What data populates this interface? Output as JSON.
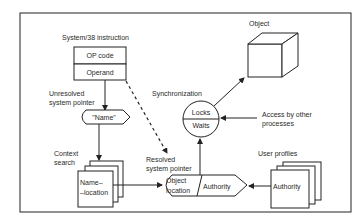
{
  "diagram": {
    "instruction": {
      "title": "System/38 instruction",
      "opcode": "OP code",
      "operand": "Operand"
    },
    "unresolved_label_line1": "Unresolved",
    "unresolved_label_line2": "system pointer",
    "name_token": "\"Name\"",
    "context_label_line1": "Context",
    "context_label_line2": "search",
    "name_location_line1": "Name–",
    "name_location_line2": "–location",
    "resolved_label_line1": "Resolved",
    "resolved_label_line2": "system pointer",
    "resolved_pointer": {
      "left_line1": "Object",
      "left_line2": "location",
      "right": "Authority"
    },
    "synchronization_label": "Synchronization",
    "sync_circle": {
      "top": "Locks",
      "bottom": "Waits"
    },
    "access_label_line1": "Access by other",
    "access_label_line2": "processes",
    "object_label": "Object",
    "user_profiles_label": "User profiles",
    "user_profile_card": "Authority"
  }
}
